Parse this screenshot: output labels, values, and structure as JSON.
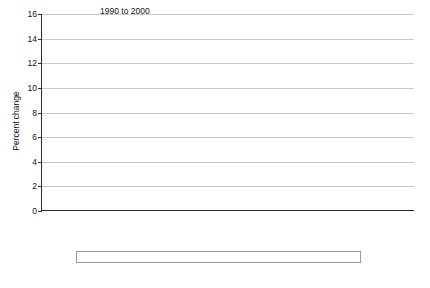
{
  "chart_data": {
    "type": "bar",
    "title": "",
    "xlabel": "",
    "ylabel": "Percent change",
    "ylim": [
      0,
      16
    ],
    "ytick_step": 2,
    "yticks": [
      0,
      2,
      4,
      6,
      8,
      10,
      12,
      14,
      16
    ],
    "grid": true,
    "legend_position": "bottom",
    "panels": [
      {
        "label": "1990 to 2000",
        "categories": [
          "Nonmetro not adjacent",
          "Nonmetro adjacent",
          "Metropolitan"
        ],
        "series": [
          {
            "name": "Population change",
            "values": [
              6.4,
              10.5,
              14.0
            ]
          },
          {
            "name": "Natural increase",
            "values": [
              3.0,
              3.1,
              7.7
            ]
          },
          {
            "name": "Net migration",
            "values": [
              3.4,
              7.4,
              6.3
            ]
          }
        ]
      },
      {
        "label": "2000 to 2010",
        "categories": [
          "Nonmetro not adjacent",
          "Nonmetro adjacent",
          "Metropolitan"
        ],
        "series": [
          {
            "name": "Population change",
            "values": [
              2.7,
              5.5,
              10.7
            ]
          },
          {
            "name": "Natural increase",
            "values": [
              2.5,
              2.4,
              6.8
            ]
          },
          {
            "name": "Net migration",
            "values": [
              0.3,
              3.1,
              4.0
            ]
          }
        ]
      }
    ],
    "series_colors": [
      "#e3e3e3",
      "#6b6b6b",
      "#b5b5b5"
    ],
    "legend": [
      {
        "name": "Population change",
        "color": "#e3e3e3"
      },
      {
        "name": "Natural increase",
        "color": "#6b6b6b"
      },
      {
        "name": "Net migration",
        "color": "#b5b5b5"
      }
    ],
    "category_label_lines": [
      [
        "Nonmetro",
        "not adjacent"
      ],
      [
        "Nonmetro",
        "adjacent"
      ],
      [
        "Metropolitan",
        ""
      ]
    ]
  }
}
